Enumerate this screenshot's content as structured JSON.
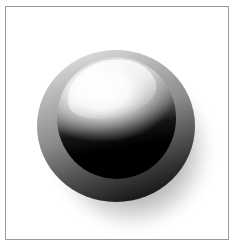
{
  "graphic": {
    "description": "Glossy spherical button with outer gray ring, upper-left highlight and drop shadow inside a thin gray frame",
    "frame_color": "#9a9a9a",
    "background_color": "#ffffff",
    "ring_colors": [
      "#f2f2f2",
      "#8a8a8a",
      "#000000"
    ],
    "sphere_colors": [
      "#ffffff",
      "#6a6a6a",
      "#000000"
    ]
  }
}
